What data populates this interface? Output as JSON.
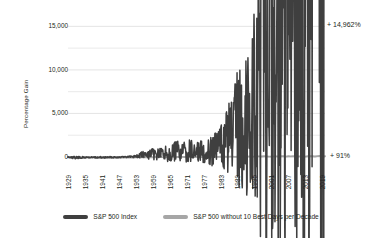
{
  "chart_data": {
    "type": "line",
    "title": "",
    "xlabel": "",
    "ylabel": "Percentage Gain",
    "xlim": [
      1929,
      2020
    ],
    "ylim": [
      0,
      15500
    ],
    "yticks": [
      0,
      5000,
      10000,
      15000
    ],
    "ytick_labels": [
      "0",
      "5,000",
      "10,000",
      "15,000"
    ],
    "y_minor_gridlines": [
      2500,
      7500,
      12500
    ],
    "grid": true,
    "legend_position": "bottom",
    "xticks": [
      1929,
      1935,
      1941,
      1947,
      1953,
      1959,
      1965,
      1971,
      1977,
      1983,
      1989,
      1995,
      2001,
      2007,
      2013,
      2019
    ],
    "xtick_labels": [
      "1929",
      "1935",
      "1941",
      "1947",
      "1953",
      "1959",
      "1965",
      "1971",
      "1977",
      "1983",
      "1989",
      "1995",
      "2001",
      "2007",
      "2013",
      "2019"
    ],
    "annotations": [
      {
        "text": "+ 14,962%",
        "series": "S&P 500 Index",
        "value": 14962
      },
      {
        "text": "+ 91%",
        "series": "S&P 500 without 10 Best Days per Decade",
        "value": 91
      }
    ],
    "series": [
      {
        "name": "S&P 500 Index",
        "color": "#3f3f3f",
        "x": [
          1929,
          1930,
          1931,
          1932,
          1933,
          1934,
          1935,
          1936,
          1937,
          1938,
          1939,
          1940,
          1941,
          1942,
          1943,
          1944,
          1945,
          1946,
          1947,
          1948,
          1949,
          1950,
          1951,
          1952,
          1953,
          1954,
          1955,
          1956,
          1957,
          1958,
          1959,
          1960,
          1961,
          1962,
          1963,
          1964,
          1965,
          1966,
          1967,
          1968,
          1969,
          1970,
          1971,
          1972,
          1973,
          1974,
          1975,
          1976,
          1977,
          1978,
          1979,
          1980,
          1981,
          1982,
          1983,
          1984,
          1985,
          1986,
          1987,
          1988,
          1989,
          1990,
          1991,
          1992,
          1993,
          1994,
          1995,
          1996,
          1997,
          1998,
          1999,
          2000,
          2001,
          2002,
          2003,
          2004,
          2005,
          2006,
          2007,
          2008,
          2009,
          2010,
          2011,
          2012,
          2013,
          2014,
          2015,
          2016,
          2017,
          2018,
          2019,
          2020
        ],
        "values": [
          0,
          -32,
          -68,
          -80,
          -62,
          -65,
          -45,
          -25,
          -48,
          -40,
          -44,
          -52,
          -62,
          -55,
          -38,
          -27,
          -6,
          -15,
          -12,
          -8,
          3,
          25,
          50,
          65,
          60,
          135,
          205,
          220,
          190,
          290,
          320,
          310,
          400,
          350,
          450,
          530,
          560,
          480,
          600,
          650,
          560,
          560,
          620,
          730,
          620,
          430,
          580,
          720,
          660,
          680,
          790,
          1030,
          940,
          1140,
          1410,
          1460,
          1900,
          2230,
          2300,
          2680,
          3500,
          3330,
          4290,
          4560,
          4960,
          4960,
          6830,
          8350,
          11080,
          14180,
          17100,
          15460,
          13510,
          10400,
          13500,
          14900,
          15500,
          17800,
          18700,
          11600,
          14500,
          16600,
          16800,
          19300,
          25200,
          28500,
          28000,
          31000,
          37500,
          35500,
          46500,
          49000
        ]
      },
      {
        "name": "S&P 500 without 10 Best Days per Decade",
        "color": "#a6a6a6",
        "x": [
          1929,
          1935,
          1941,
          1947,
          1953,
          1959,
          1965,
          1971,
          1977,
          1983,
          1989,
          1995,
          2001,
          2007,
          2013,
          2019,
          2020
        ],
        "values": [
          0,
          -70,
          -72,
          -55,
          -40,
          -20,
          5,
          10,
          0,
          15,
          35,
          55,
          60,
          75,
          70,
          88,
          91
        ]
      }
    ]
  },
  "legend": {
    "items": [
      {
        "label": "S&P 500 Index",
        "color": "#3f3f3f"
      },
      {
        "label": "S&P 500 without 10 Best Days per Decade",
        "color": "#a6a6a6"
      }
    ]
  },
  "colors": {
    "primary_series": "#3f3f3f",
    "secondary_series": "#a6a6a6",
    "gridline": "#d9d9d9",
    "text": "#231f20",
    "background": "#ffffff"
  }
}
